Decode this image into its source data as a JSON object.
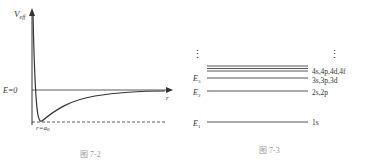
{
  "figure1": {
    "caption": "图 7-2",
    "y_axis_label": "V",
    "y_axis_sub": "eff",
    "x_axis_label": "r",
    "zero_label": "E=0",
    "min_label": "r=a",
    "min_sub": "0"
  },
  "figure2": {
    "caption": "图 7-3",
    "ellipsis": "⋮",
    "levels": [
      {
        "label": "E",
        "sub": "1",
        "states": "1s"
      },
      {
        "label": "E",
        "sub": "2",
        "states": "2s,2p"
      },
      {
        "label": "E",
        "sub": "3",
        "states": "3s,3p,3d"
      },
      {
        "label": "",
        "sub": "",
        "states": "4s,4p,4d,4f"
      }
    ]
  }
}
